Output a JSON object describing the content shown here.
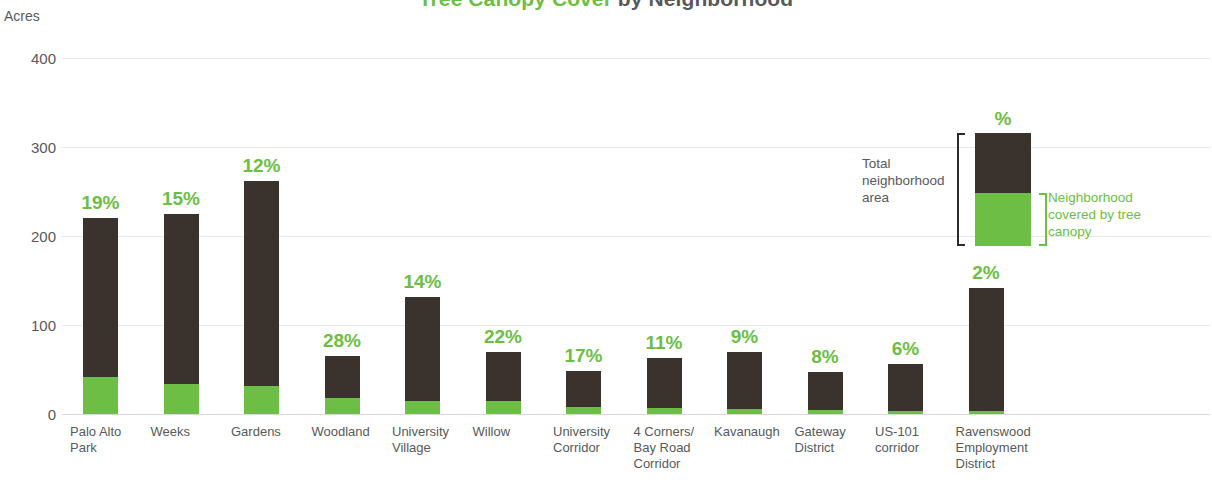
{
  "title": {
    "highlight": "Tree Canopy Cover",
    "rest": " by Neighborhood",
    "highlight_color": "#6cbe45",
    "rest_color": "#58595b"
  },
  "axis": {
    "unit_label": "Acres",
    "y_ticks": [
      "400",
      "300",
      "200",
      "100",
      "0"
    ]
  },
  "legend": {
    "percent_label": "%",
    "left_text": "Total neighborhood area",
    "right_text": "Neighborhood covered by tree canopy"
  },
  "colors": {
    "canopy_green": "#6cbe45",
    "total_dark": "#3a322c",
    "text_gray": "#58595b",
    "gridline": "#e8e8e8"
  },
  "chart_data": {
    "type": "bar",
    "title": "Tree Canopy Cover by Neighborhood",
    "xlabel": "",
    "ylabel": "Acres",
    "ylim": [
      0,
      400
    ],
    "yticks": [
      0,
      100,
      200,
      300,
      400
    ],
    "grid": true,
    "stacked": true,
    "legend_position": "inside-top-right",
    "categories": [
      "Palo Alto Park",
      "Weeks",
      "Gardens",
      "Woodland",
      "University Village",
      "Willow",
      "University Corridor",
      "4 Corners/ Bay Road Corridor",
      "Kavanaugh",
      "Gateway District",
      "US-101 corridor",
      "Ravenswood Employment District"
    ],
    "series": [
      {
        "name": "Total neighborhood area",
        "color": "#3a322c",
        "values": [
          220,
          225,
          262,
          65,
          132,
          70,
          48,
          63,
          70,
          47,
          56,
          142
        ]
      },
      {
        "name": "Neighborhood covered by tree canopy",
        "color": "#6cbe45",
        "values": [
          42,
          34,
          31,
          18,
          15,
          15,
          8,
          7,
          6,
          4,
          3,
          3
        ]
      }
    ],
    "data_labels": [
      "19%",
      "15%",
      "12%",
      "28%",
      "14%",
      "22%",
      "17%",
      "11%",
      "9%",
      "8%",
      "6%",
      "2%"
    ]
  }
}
